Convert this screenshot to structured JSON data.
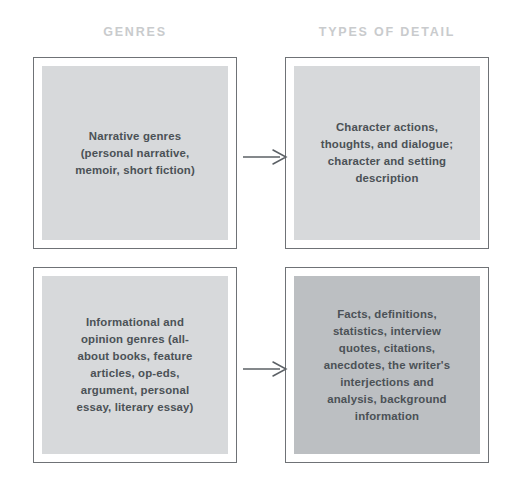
{
  "columns": {
    "left_header": "GENRES",
    "right_header": "TYPES OF DETAIL"
  },
  "colors": {
    "header_text": "#c9cbcd",
    "box_border": "#6f7276",
    "fill_light": "#d7d9db",
    "fill_dark": "#bcbfc2",
    "body_text": "#4b5156",
    "arrow": "#5b6065",
    "background": "#ffffff"
  },
  "rows": [
    {
      "genre": {
        "text": "Narrative genres\n(personal narrative,\nmemoir, short fiction)",
        "fill": "light"
      },
      "detail": {
        "text": "Character actions,\nthoughts, and dialogue;\ncharacter and setting\ndescription",
        "fill": "light"
      },
      "connector": "arrow-right"
    },
    {
      "genre": {
        "text": "Informational and\nopinion genres (all-\nabout books, feature\narticles, op-eds,\nargument, personal\nessay, literary essay)",
        "fill": "light"
      },
      "detail": {
        "text": "Facts, definitions,\nstatistics, interview\nquotes, citations,\nanecdotes, the writer's\ninterjections and\nanalysis, background\ninformation",
        "fill": "dark"
      },
      "connector": "arrow-right"
    }
  ]
}
